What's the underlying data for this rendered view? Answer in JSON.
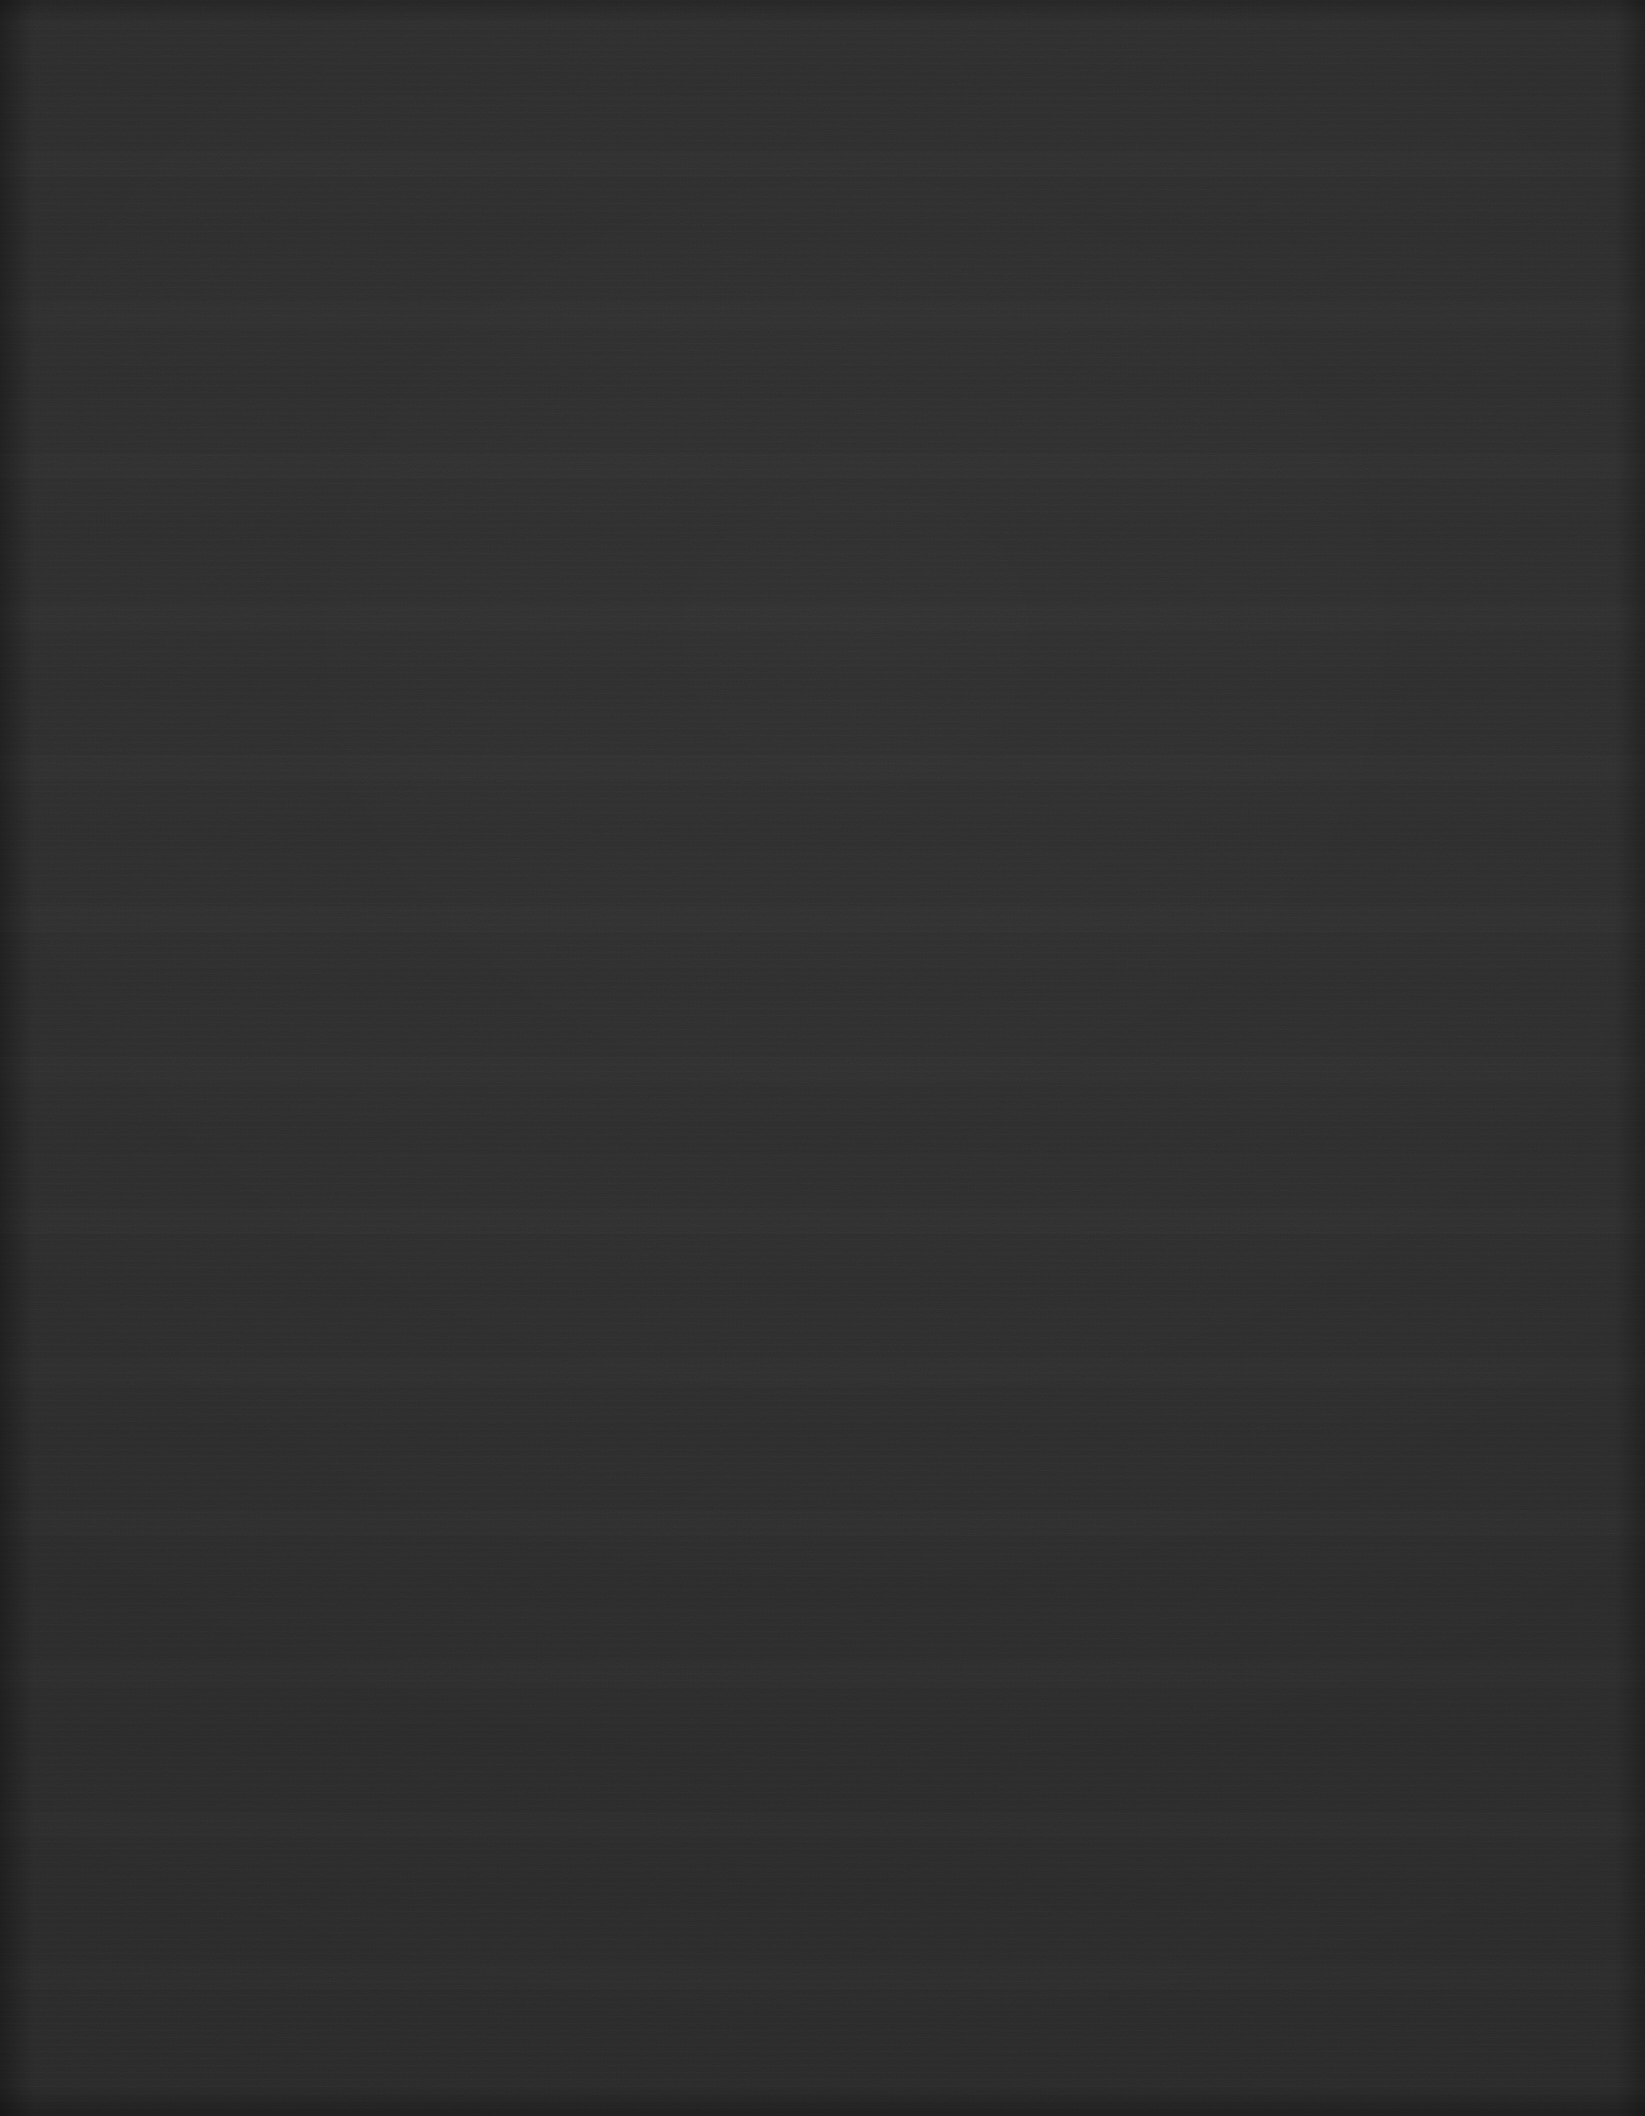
{
  "image": {
    "description": "Uniformly dark, near-black frame with no visible user-interface elements, text, icons, or graphics.",
    "content_type": "blank-dark-frame",
    "width_px": 1645,
    "height_px": 2116,
    "surface_color": "#2b2b2b",
    "darkest_tone": "#1f1f1f",
    "lightest_tone": "#343434",
    "has_text": false,
    "has_icons": false,
    "has_chart": false,
    "has_controls": false,
    "features": [
      "fine film-grain / sensor noise across the entire field",
      "faint horizontal banding resembling scan lines",
      "subtle luminance drift slightly brighter toward the upper-centre",
      "mild vignette darkening at the outer edges",
      "isolated single-pixel bright speckles consistent with noise"
    ]
  }
}
